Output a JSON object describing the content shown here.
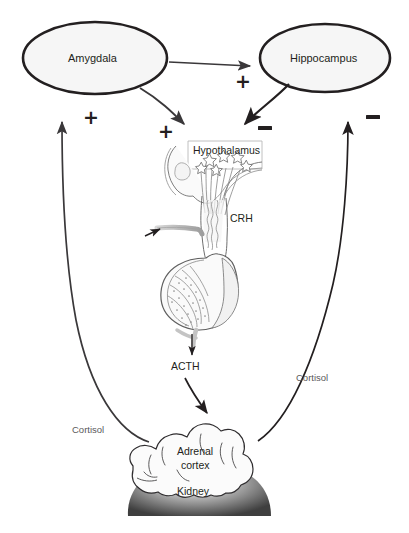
{
  "figure": {
    "type": "biological-pathway-diagram",
    "background_color": "#ffffff",
    "stroke_color": "#231f20",
    "node_fill": "#f6f6f6"
  },
  "nodes": [
    {
      "id": "amygdala",
      "label": "Amygdala",
      "shape": "ellipse",
      "cx": 95,
      "cy": 58,
      "rx": 72,
      "ry": 36
    },
    {
      "id": "hippocampus",
      "label": "Hippocampus",
      "shape": "ellipse",
      "cx": 325,
      "cy": 58,
      "rx": 65,
      "ry": 34
    }
  ],
  "structure_labels": {
    "hypothalamus": "Hypothalamus",
    "crh": "CRH",
    "acth": "ACTH",
    "adrenal_cortex_line1": "Adrenal",
    "adrenal_cortex_line2": "cortex",
    "kidney": "Kidney"
  },
  "feedback_labels": {
    "cortisol_left": "Cortisol",
    "cortisol_right": "Cortisol"
  },
  "signs": [
    {
      "id": "plus-amygdala-feedback",
      "symbol": "+",
      "x": 83,
      "y": 108,
      "meaning": "cortisol excites amygdala"
    },
    {
      "id": "plus-amygdala-to-hypothalamus",
      "symbol": "+",
      "x": 158,
      "y": 122,
      "meaning": "amygdala excites hypothalamus"
    },
    {
      "id": "plus-amygdala-to-hippocampus",
      "symbol": "+",
      "x": 235,
      "y": 72,
      "meaning": "amygdala excites hippocampus"
    },
    {
      "id": "minus-hippocampus-to-hypothalamus",
      "symbol": "−",
      "x": 258,
      "y": 126,
      "meaning": "hippocampus inhibits hypothalamus"
    },
    {
      "id": "minus-hippocampus-feedback",
      "symbol": "−",
      "x": 366,
      "y": 115,
      "meaning": "cortisol inhibits hippocampus"
    }
  ],
  "arrows": [
    {
      "id": "amygdala-to-hippocampus",
      "from": "amygdala",
      "to": "hippocampus",
      "sign": "+"
    },
    {
      "id": "amygdala-to-hypothalamus",
      "from": "amygdala",
      "to": "hypothalamus",
      "sign": "+"
    },
    {
      "id": "hippocampus-to-hypothalamus",
      "from": "hippocampus",
      "to": "hypothalamus",
      "sign": "−"
    },
    {
      "id": "pituitary-to-acth",
      "from": "pituitary",
      "to": "acth",
      "sign": ""
    },
    {
      "id": "acth-to-adrenal",
      "from": "acth",
      "to": "adrenal cortex",
      "sign": ""
    },
    {
      "id": "cortisol-to-amygdala",
      "from": "adrenal cortex",
      "to": "amygdala",
      "sign": "+"
    },
    {
      "id": "cortisol-to-hippocampus",
      "from": "adrenal cortex",
      "to": "hippocampus",
      "sign": "−"
    },
    {
      "id": "vessel-pointer",
      "from": "pointer",
      "to": "portal vessel",
      "sign": ""
    }
  ]
}
